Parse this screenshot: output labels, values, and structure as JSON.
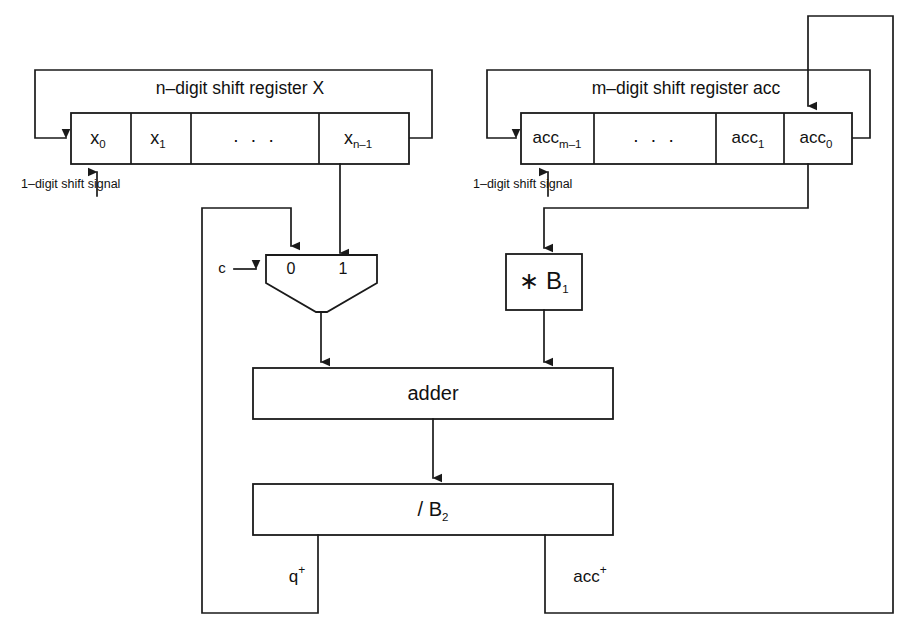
{
  "diagram": {
    "background_color": "#ffffff",
    "line_color": "#1a1a1a"
  },
  "registers": {
    "x_register": {
      "title": "n–digit shift register X",
      "cells": [
        {
          "base": "x",
          "sub": "0",
          "name": "cell-x0"
        },
        {
          "base": "x",
          "sub": "1",
          "name": "cell-x1"
        },
        {
          "base": "· · ·",
          "sub": "",
          "name": "cell-x-ellipsis"
        },
        {
          "base": "x",
          "sub": "n–1",
          "name": "cell-xn1"
        }
      ],
      "shift_signal_label": "1–digit shift signal"
    },
    "acc_register": {
      "title": "m–digit shift register acc",
      "cells": [
        {
          "base": "acc",
          "sub": "m–1",
          "name": "cell-accm1"
        },
        {
          "base": "· · ·",
          "sub": "",
          "name": "cell-acc-ellipsis"
        },
        {
          "base": "acc",
          "sub": "1",
          "name": "cell-acc1"
        },
        {
          "base": "acc",
          "sub": "0",
          "name": "cell-acc0"
        }
      ],
      "shift_signal_label": "1–digit shift signal"
    }
  },
  "mux": {
    "select_label": "c",
    "port_0_label": "0",
    "port_1_label": "1"
  },
  "blocks": {
    "multiplier": {
      "base": "∗ B",
      "sub": "1"
    },
    "adder": {
      "label": "adder"
    },
    "divider": {
      "base": "/ B",
      "sub": "2"
    }
  },
  "outputs": {
    "q_plus": {
      "base": "q",
      "sup": "+"
    },
    "acc_plus": {
      "base": "acc",
      "sup": "+"
    }
  }
}
